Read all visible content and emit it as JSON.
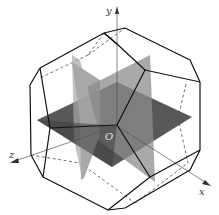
{
  "figure": {
    "axes": {
      "x_label": "x",
      "y_label": "y",
      "z_label": "z",
      "origin_label": "O"
    },
    "colors": {
      "edge": "#111111",
      "hidden_edge": "#333333",
      "plane_xz": "#4a4a4a",
      "plane_xy": "#8a8a8a",
      "plane_yz": "#a5a5a5",
      "axis": "#444444",
      "background": "#ffffff"
    }
  }
}
